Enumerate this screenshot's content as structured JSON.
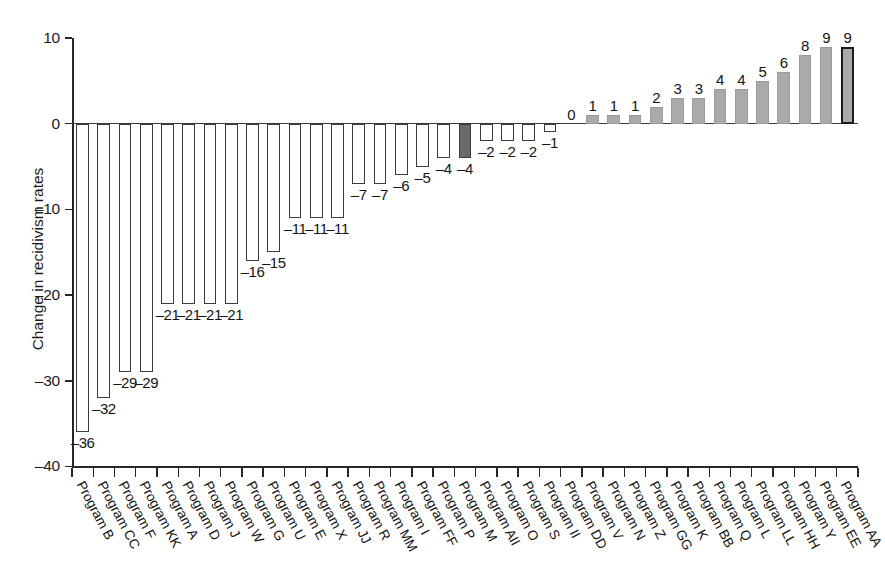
{
  "chart_data": {
    "type": "bar",
    "title": "",
    "xlabel": "",
    "ylabel": "Change in recidivism rates",
    "ylim": [
      -40,
      10
    ],
    "ytick_labels": [
      "10",
      "0",
      "–10",
      "–20",
      "–30",
      "–40"
    ],
    "ytick_values": [
      10,
      0,
      -10,
      -20,
      -30,
      -40
    ],
    "grid": false,
    "legend": "none",
    "categories": [
      "Program B",
      "Program CC",
      "Program F",
      "Program KK",
      "Program A",
      "Program D",
      "Program J",
      "Program W",
      "Program G",
      "Program U",
      "Program E",
      "Program X",
      "Program JJ",
      "Program R",
      "Program MM",
      "Program I",
      "Program FF",
      "Program P",
      "Program M",
      "Program AII",
      "Program O",
      "Program S",
      "Program II",
      "Program DD",
      "Program V",
      "Program N",
      "Program Z",
      "Program GG",
      "Program K",
      "Program BB",
      "Program Q",
      "Program L",
      "Program LL",
      "Program HH",
      "Program Y",
      "Program EE",
      "Program AA"
    ],
    "values": [
      -36,
      -32,
      -29,
      -29,
      -21,
      -21,
      -21,
      -21,
      -16,
      -15,
      -11,
      -11,
      -11,
      -7,
      -7,
      -6,
      -5,
      -4,
      -4,
      -2,
      -2,
      -2,
      -1,
      0,
      1,
      1,
      1,
      2,
      3,
      3,
      4,
      4,
      5,
      6,
      8,
      9,
      9
    ],
    "value_labels": [
      "–36",
      "–32",
      "–29",
      "–29",
      "–21",
      "–21",
      "–21",
      "–21",
      "–16",
      "–15",
      "–11",
      "–11",
      "–11",
      "–7",
      "–7",
      "–6",
      "–5",
      "–4",
      "–4",
      "–2",
      "–2",
      "–2",
      "–1",
      "0",
      "1",
      "1",
      "1",
      "2",
      "3",
      "3",
      "4",
      "4",
      "5",
      "6",
      "8",
      "9",
      "9"
    ],
    "bar_styles": [
      "neg",
      "neg",
      "neg",
      "neg",
      "neg",
      "neg",
      "neg",
      "neg",
      "neg",
      "neg",
      "neg",
      "neg",
      "neg",
      "neg",
      "neg",
      "neg",
      "neg",
      "neg",
      "neg-highlight",
      "neg",
      "neg",
      "neg",
      "neg",
      "pos",
      "pos",
      "pos",
      "pos",
      "pos",
      "pos",
      "pos",
      "pos",
      "pos",
      "pos",
      "pos",
      "pos",
      "pos",
      "pos-outline"
    ],
    "colors": {
      "negative_fill": "#ffffff",
      "negative_stroke": "#3c3c3c",
      "highlight_fill": "#6a6a6a",
      "positive_fill": "#aaaaaa",
      "outlined_stroke": "#1c1c1c",
      "axis": "#262626",
      "text": "#1a1a1a"
    }
  }
}
